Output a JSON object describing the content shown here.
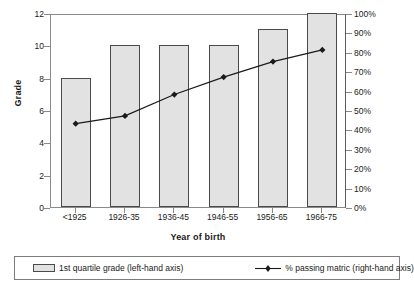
{
  "chart_data": {
    "type": "bar",
    "title": "",
    "categories": [
      "<1925",
      "1926-35",
      "1936-45",
      "1946-55",
      "1956-65",
      "1966-75"
    ],
    "xlabel": "Year of birth",
    "ylabel": "Grade",
    "ylabel_right": "",
    "ylim": [
      0,
      12
    ],
    "ylim_right": [
      0,
      100
    ],
    "yticks": [
      "0",
      "2",
      "4",
      "6",
      "8",
      "10",
      "12"
    ],
    "ytick_values": [
      0,
      2,
      4,
      6,
      8,
      10,
      12
    ],
    "yticks_right": [
      "0%",
      "10%",
      "20%",
      "30%",
      "40%",
      "50%",
      "60%",
      "70%",
      "80%",
      "90%",
      "100%"
    ],
    "ytick_values_right": [
      0,
      10,
      20,
      30,
      40,
      50,
      60,
      70,
      80,
      90,
      100
    ],
    "grid": false,
    "legend_position": "bottom",
    "series": [
      {
        "name": "1st quartile grade (left-hand axis)",
        "type": "bar",
        "axis": "left",
        "values": [
          8,
          10,
          10,
          10,
          11,
          12
        ],
        "fill_color": "#e2e2e2",
        "edge_color": "#4a4a4a"
      },
      {
        "name": "% passing matric (right-hand axis)",
        "type": "line",
        "axis": "right",
        "values": [
          44,
          48,
          59,
          68,
          76,
          82
        ],
        "line_color": "#1a1a1a",
        "marker": "diamond"
      }
    ]
  },
  "legend": {
    "items": [
      {
        "label": "1st quartile grade (left-hand axis)",
        "marker": "box"
      },
      {
        "label": "% passing matric (right-hand axis)",
        "marker": "line-diamond"
      }
    ]
  }
}
